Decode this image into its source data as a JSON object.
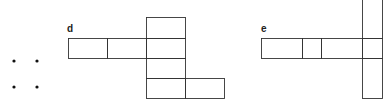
{
  "figures": [
    {
      "label": "d"
    },
    {
      "label": "e"
    }
  ],
  "colors": {
    "line": "#333333",
    "dot": "#111111",
    "background": "#ffffff"
  }
}
